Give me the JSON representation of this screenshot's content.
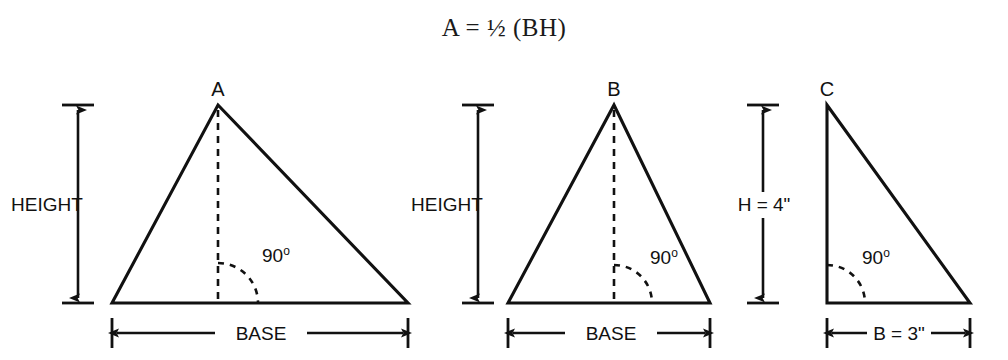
{
  "title": {
    "formula": "A = ½ (BH)"
  },
  "panels": [
    {
      "id": "panel-scalene",
      "vertex_label": "A",
      "height_label": "HEIGHT",
      "base_label": "BASE",
      "angle_label": "90",
      "angle_degree_symbol": "o",
      "shape": "scalene-triangle",
      "height_line_style": "dashed",
      "height_label_placement": "left-of-line"
    },
    {
      "id": "panel-isosceles",
      "vertex_label": "B",
      "height_label": "HEIGHT",
      "base_label": "BASE",
      "angle_label": "90",
      "angle_degree_symbol": "o",
      "shape": "isosceles-triangle",
      "height_line_style": "dashed",
      "height_label_placement": "left-of-line"
    },
    {
      "id": "panel-right",
      "vertex_label": "C",
      "height_label": "H = 4\"",
      "base_label": "B = 3\"",
      "angle_label": "90",
      "angle_degree_symbol": "o",
      "shape": "right-triangle",
      "height_line_style": "solid-side",
      "height_label_placement": "on-line"
    }
  ],
  "colors": {
    "ink": "#111111",
    "background": "#ffffff"
  }
}
